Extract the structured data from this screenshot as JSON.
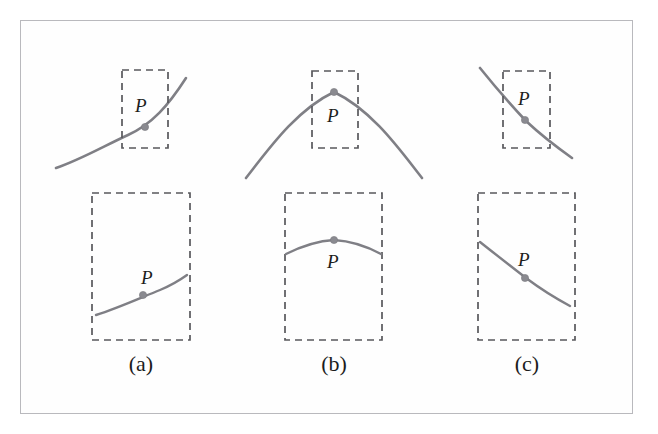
{
  "figure": {
    "background_color": "#ffffff",
    "border_color": "#b9b9bd",
    "curve_color": "#7f7f85",
    "box_color": "#58585c",
    "dot_color": "#8a8a90",
    "label_color": "#1c1c1c",
    "point_label": "P"
  },
  "panels": [
    {
      "id": "a",
      "label": "(a)",
      "description": "increasing concave-up curve through P",
      "top": {
        "point_label": "P",
        "curve_shape": "increasing-concave-up",
        "zoom_box": {
          "x": 122,
          "y": 70,
          "width": 46,
          "height": 78
        },
        "point": {
          "x": 145,
          "y": 127
        },
        "label_pos": {
          "x": 135,
          "y": 112
        }
      },
      "bottom": {
        "point_label": "P",
        "curve_shape": "nearly-straight-increasing",
        "zoom_box": {
          "x": 92,
          "y": 193,
          "width": 98,
          "height": 147
        },
        "point": {
          "x": 143,
          "y": 295
        },
        "label_pos": {
          "x": 141,
          "y": 284
        }
      }
    },
    {
      "id": "b",
      "label": "(b)",
      "description": "parabola with maximum at P",
      "top": {
        "point_label": "P",
        "curve_shape": "parabola-vertex",
        "zoom_box": {
          "x": 312,
          "y": 71,
          "width": 46,
          "height": 77
        },
        "point": {
          "x": 334,
          "y": 92
        },
        "label_pos": {
          "x": 327,
          "y": 122
        }
      },
      "bottom": {
        "point_label": "P",
        "curve_shape": "gentle-arc-maximum",
        "zoom_box": {
          "x": 285,
          "y": 193,
          "width": 97,
          "height": 147
        },
        "point": {
          "x": 334,
          "y": 240
        },
        "label_pos": {
          "x": 330,
          "y": 268
        }
      }
    },
    {
      "id": "c",
      "label": "(c)",
      "description": "decreasing curve through P",
      "top": {
        "point_label": "P",
        "curve_shape": "decreasing-inflecting",
        "zoom_box": {
          "x": 503,
          "y": 71,
          "width": 47,
          "height": 77
        },
        "point": {
          "x": 525,
          "y": 120
        },
        "label_pos": {
          "x": 523,
          "y": 105
        }
      },
      "bottom": {
        "point_label": "P",
        "curve_shape": "nearly-straight-decreasing",
        "zoom_box": {
          "x": 478,
          "y": 193,
          "width": 97,
          "height": 147
        },
        "point": {
          "x": 525,
          "y": 278
        },
        "label_pos": {
          "x": 524,
          "y": 266
        }
      }
    }
  ],
  "panel_labels": [
    {
      "text": "(a)",
      "x": 141,
      "y": 371
    },
    {
      "text": "(b)",
      "x": 334,
      "y": 371
    },
    {
      "text": "(c)",
      "x": 527,
      "y": 371
    }
  ],
  "paths": {
    "a_top_curve": "M 56 168 C 80 160 104 146 128 135 C 152 124 168 106 186 78",
    "a_bottom_curve": "M 96 315 C 118 308 140 298 160 290 C 172 285 180 280 187 275",
    "b_top_curve": "M 246 178 C 268 150 296 110 334 92 C 372 110 400 150 422 178",
    "b_bottom_curve": "M 286 254 C 300 247 316 241 334 240 C 352 241 368 247 381 254",
    "c_top_curve": "M 480 68 C 496 88 512 106 526 121 C 542 136 558 148 572 158",
    "c_bottom_curve": "M 480 242 C 495 254 512 267 526 278 C 542 290 557 299 570 306"
  }
}
